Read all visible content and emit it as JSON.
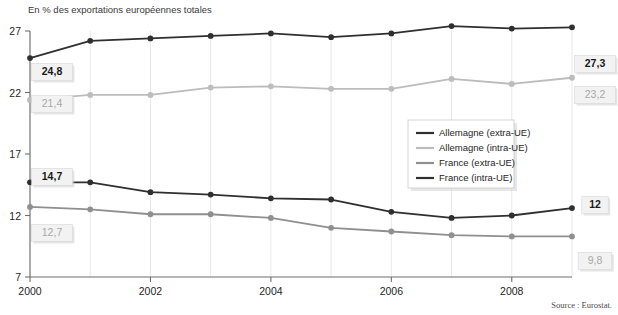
{
  "chart_data": {
    "type": "line",
    "title": "En % des exportations européennes totales",
    "xlabel": "",
    "ylabel": "",
    "x": [
      2000,
      2001,
      2002,
      2003,
      2004,
      2005,
      2006,
      2007,
      2008,
      2009
    ],
    "xlim": [
      2000,
      2009
    ],
    "ylim": [
      7,
      27
    ],
    "yticks": [
      7,
      12,
      17,
      22,
      27
    ],
    "xticks": [
      2000,
      2002,
      2004,
      2006,
      2008
    ],
    "xtick_labels": [
      "2000",
      "2002",
      "2004",
      "2006",
      "2008"
    ],
    "ytick_labels": [
      "7",
      "12",
      "17",
      "22",
      "27"
    ],
    "grid": true,
    "grid_axis": "x",
    "legend_position": "center-right",
    "series": [
      {
        "name": "Allemagne (extra-UE)",
        "color": "#2f2f2f",
        "values": [
          24.8,
          26.2,
          26.4,
          26.6,
          26.8,
          26.5,
          26.8,
          27.4,
          27.2,
          27.3
        ],
        "start_label": "24,8",
        "end_label": "27,3",
        "label_style": "bold"
      },
      {
        "name": "Allemagne (intra-UE)",
        "color": "#bcbcbc",
        "values": [
          21.4,
          21.8,
          21.8,
          22.4,
          22.5,
          22.3,
          22.3,
          23.1,
          22.7,
          23.2
        ],
        "start_label": "21,4",
        "end_label": "23,2",
        "label_style": "muted"
      },
      {
        "name": "France (extra-UE)",
        "color": "#8f8f8f",
        "values": [
          12.7,
          12.5,
          12.1,
          12.1,
          11.8,
          11.0,
          10.7,
          10.4,
          10.3,
          10.3
        ],
        "start_label": "12,7",
        "end_label": "9,8",
        "label_style": "muted"
      },
      {
        "name": "France (intra-UE)",
        "color": "#2f2f2f",
        "values": [
          14.7,
          14.7,
          13.9,
          13.7,
          13.4,
          13.3,
          12.3,
          11.8,
          12.0,
          12.6
        ],
        "start_label": "14,7",
        "end_label": "12",
        "label_style": "bold"
      }
    ],
    "annotations": {
      "left_labels": [
        {
          "text": "24,8",
          "style": "bold"
        },
        {
          "text": "21,4",
          "style": "muted"
        },
        {
          "text": "14,7",
          "style": "bold"
        },
        {
          "text": "12,7",
          "style": "muted"
        }
      ],
      "right_labels": [
        {
          "text": "27,3",
          "style": "bold"
        },
        {
          "text": "23,2",
          "style": "muted"
        },
        {
          "text": "12",
          "style": "bold"
        },
        {
          "text": "9,8",
          "style": "muted"
        }
      ]
    },
    "source": "Source : Eurostat."
  },
  "legend": {
    "items": [
      {
        "label": "Allemagne (extra-UE)",
        "color": "#2f2f2f"
      },
      {
        "label": "Allemagne (intra-UE)",
        "color": "#bcbcbc"
      },
      {
        "label": "France (extra-UE)",
        "color": "#8f8f8f"
      },
      {
        "label": "France (intra-UE)",
        "color": "#2f2f2f"
      }
    ]
  },
  "colors": {
    "dark_series": "#2f2f2f",
    "light_series": "#bcbcbc",
    "mid_series": "#8f8f8f",
    "grid": "#e2e2e2",
    "axis": "#6e6e6e",
    "callout_bg": "#f2f2f2",
    "background": "#ffffff"
  }
}
